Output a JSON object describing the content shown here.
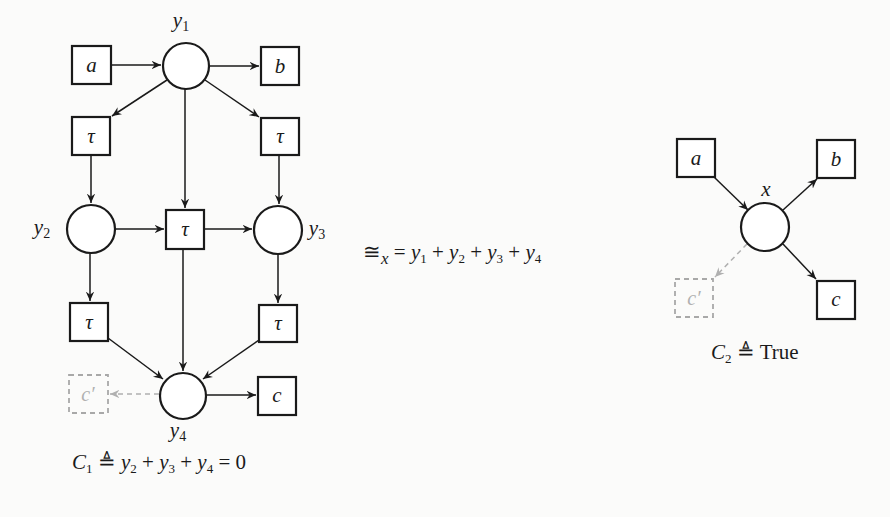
{
  "left_diagram": {
    "places": [
      {
        "id": "y1",
        "label": "y",
        "sub": "1",
        "cx": 186,
        "cy": 66
      },
      {
        "id": "y2",
        "label": "y",
        "sub": "2",
        "cx": 91,
        "cy": 229
      },
      {
        "id": "y3",
        "label": "y",
        "sub": "3",
        "cx": 278,
        "cy": 230
      },
      {
        "id": "y4",
        "label": "y",
        "sub": "4",
        "cx": 183,
        "cy": 396
      }
    ],
    "transitions": [
      {
        "id": "a",
        "label": "a"
      },
      {
        "id": "b",
        "label": "b"
      },
      {
        "id": "tau_left_top",
        "label": "τ"
      },
      {
        "id": "tau_right_top",
        "label": "τ"
      },
      {
        "id": "tau_middle",
        "label": "τ"
      },
      {
        "id": "tau_left_bottom",
        "label": "τ"
      },
      {
        "id": "tau_right_bottom",
        "label": "τ"
      },
      {
        "id": "c",
        "label": "c"
      },
      {
        "id": "c_prime",
        "label": "c′",
        "ghost": true
      }
    ],
    "constraint": {
      "name": "C",
      "name_sub": "1",
      "def_symbol": "≜",
      "expr_terms": [
        {
          "var": "y",
          "sub": "2"
        },
        {
          "var": "y",
          "sub": "3"
        },
        {
          "var": "y",
          "sub": "4"
        }
      ],
      "op": "+",
      "rhs": "= 0"
    }
  },
  "relation": {
    "symbol": "≅",
    "subscript": "x",
    "eq": "=",
    "terms": [
      {
        "var": "y",
        "sub": "1"
      },
      {
        "var": "y",
        "sub": "2"
      },
      {
        "var": "y",
        "sub": "3"
      },
      {
        "var": "y",
        "sub": "4"
      }
    ],
    "op": "+"
  },
  "right_diagram": {
    "place": {
      "id": "x",
      "label": "x",
      "cx": 765,
      "cy": 227
    },
    "transitions": [
      {
        "id": "a",
        "label": "a"
      },
      {
        "id": "b",
        "label": "b"
      },
      {
        "id": "c",
        "label": "c"
      },
      {
        "id": "c_prime",
        "label": "c′",
        "ghost": true
      }
    ],
    "constraint": {
      "name": "C",
      "name_sub": "2",
      "def_symbol": "≜",
      "value": "True"
    }
  },
  "colors": {
    "stroke": "#1a1a1a",
    "ghost": "#a8a8a8",
    "background": "#fbfbfa"
  }
}
